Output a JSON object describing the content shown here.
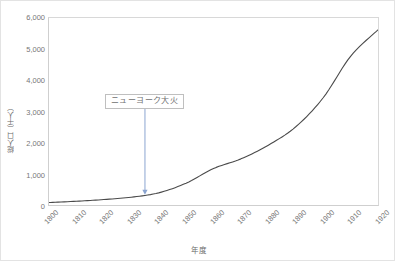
{
  "chart_data": {
    "type": "line",
    "title": "",
    "xlabel": "年度",
    "ylabel": "総人口（千人）",
    "xlim": [
      1800,
      1920
    ],
    "ylim": [
      0,
      6000
    ],
    "grid": false,
    "legend": "none",
    "x": [
      1800,
      1810,
      1820,
      1830,
      1840,
      1850,
      1860,
      1870,
      1880,
      1890,
      1900,
      1910,
      1920
    ],
    "xtick_labels": [
      "1800",
      "1810",
      "1820",
      "1830",
      "1840",
      "1850",
      "1860",
      "1870",
      "1880",
      "1890",
      "1900",
      "1910",
      "1920"
    ],
    "ytick_labels": [
      "0",
      "1,000",
      "2,000",
      "3,000",
      "4,000",
      "5,000",
      "6,000"
    ],
    "ytick_values": [
      0,
      1000,
      2000,
      3000,
      4000,
      5000,
      6000
    ],
    "series": [
      {
        "name": "総人口",
        "color": "#4a4a4a",
        "values": [
          80,
          120,
          175,
          250,
          390,
          700,
          1170,
          1480,
          1920,
          2510,
          3440,
          4770,
          5620
        ]
      }
    ],
    "annotations": [
      {
        "label": "ニューヨーク大火",
        "x": 1835,
        "y": 3000,
        "arrow_to_x": 1835,
        "arrow_to_y": 330,
        "color": "#8aa4d0"
      }
    ]
  },
  "axis": {
    "y_title": "総人口（千人）",
    "x_title": "年度"
  }
}
